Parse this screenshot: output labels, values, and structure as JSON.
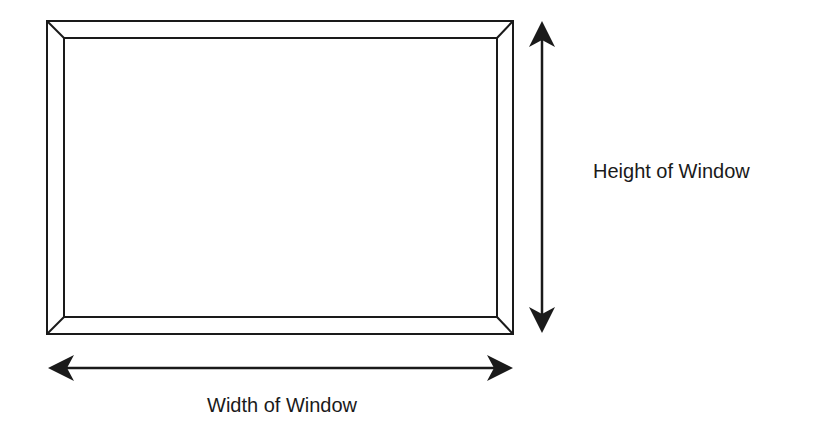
{
  "diagram": {
    "type": "window-dimensions",
    "labels": {
      "height": "Height of Window",
      "width": "Width of Window"
    },
    "colors": {
      "stroke": "#1a1a1a",
      "background": "#ffffff"
    }
  }
}
